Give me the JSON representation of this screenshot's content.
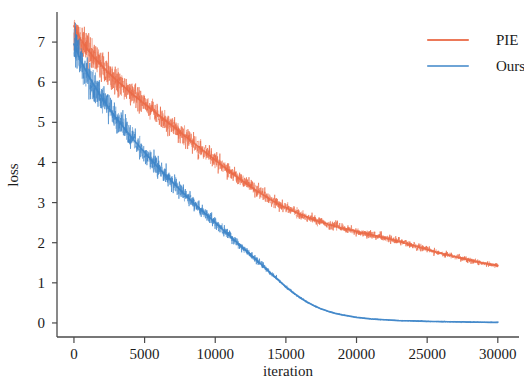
{
  "chart_data": {
    "type": "line",
    "title": "",
    "xlabel": "iteration",
    "ylabel": "loss",
    "xlim": [
      -1200,
      31500
    ],
    "ylim": [
      -0.35,
      7.75
    ],
    "xticks": [
      0,
      5000,
      10000,
      15000,
      20000,
      25000,
      30000
    ],
    "xtick_labels": [
      "0",
      "5000",
      "10000",
      "15000",
      "20000",
      "25000",
      "30000"
    ],
    "yticks": [
      0,
      1,
      2,
      3,
      4,
      5,
      6,
      7
    ],
    "ytick_labels": [
      "0",
      "1",
      "2",
      "3",
      "4",
      "5",
      "6",
      "7"
    ],
    "grid": false,
    "legend_position": "upper right",
    "series": [
      {
        "name": "PIE",
        "color": "#ea6a47",
        "noise_amplitude": 0.26,
        "x": [
          0,
          500,
          1000,
          1500,
          2000,
          2500,
          3000,
          3500,
          4000,
          4500,
          5000,
          5500,
          6000,
          6500,
          7000,
          7500,
          8000,
          8500,
          9000,
          9500,
          10000,
          10500,
          11000,
          11500,
          12000,
          12500,
          13000,
          13500,
          14000,
          14500,
          15000,
          15500,
          16000,
          16500,
          17000,
          17500,
          18000,
          18500,
          19000,
          19500,
          20000,
          20500,
          21000,
          21500,
          22000,
          22500,
          23000,
          23500,
          24000,
          24500,
          25000,
          25500,
          26000,
          26500,
          27000,
          27500,
          28000,
          28500,
          29000,
          29500,
          30000
        ],
        "values": [
          7.4,
          7.05,
          6.8,
          6.58,
          6.4,
          6.22,
          6.05,
          5.9,
          5.74,
          5.6,
          5.46,
          5.32,
          5.18,
          5.04,
          4.9,
          4.76,
          4.62,
          4.48,
          4.34,
          4.2,
          4.06,
          3.92,
          3.78,
          3.65,
          3.52,
          3.4,
          3.28,
          3.17,
          3.06,
          2.96,
          2.87,
          2.79,
          2.71,
          2.64,
          2.57,
          2.51,
          2.46,
          2.41,
          2.36,
          2.32,
          2.28,
          2.24,
          2.2,
          2.16,
          2.12,
          2.08,
          2.03,
          1.98,
          1.93,
          1.88,
          1.83,
          1.78,
          1.73,
          1.69,
          1.65,
          1.61,
          1.57,
          1.53,
          1.49,
          1.46,
          1.43
        ]
      },
      {
        "name": "Ours",
        "color": "#3d85c8",
        "noise_amplitude": 0.3,
        "x": [
          0,
          500,
          1000,
          1500,
          2000,
          2500,
          3000,
          3500,
          4000,
          4500,
          5000,
          5500,
          6000,
          6500,
          7000,
          7500,
          8000,
          8500,
          9000,
          9500,
          10000,
          10500,
          11000,
          11500,
          12000,
          12500,
          13000,
          13500,
          14000,
          14500,
          15000,
          15500,
          16000,
          16500,
          17000,
          17500,
          18000,
          18500,
          19000,
          19500,
          20000,
          20500,
          21000,
          21500,
          22000,
          22500,
          23000,
          23500,
          24000,
          24500,
          25000,
          25500,
          26000,
          26500,
          27000,
          27500,
          28000,
          28500,
          29000,
          29500,
          30000
        ],
        "values": [
          6.95,
          6.52,
          6.18,
          5.88,
          5.6,
          5.34,
          5.1,
          4.88,
          4.66,
          4.45,
          4.25,
          4.05,
          3.86,
          3.68,
          3.5,
          3.32,
          3.15,
          2.98,
          2.82,
          2.66,
          2.5,
          2.34,
          2.18,
          2.02,
          1.86,
          1.7,
          1.54,
          1.38,
          1.22,
          1.06,
          0.9,
          0.76,
          0.63,
          0.52,
          0.43,
          0.35,
          0.29,
          0.24,
          0.2,
          0.17,
          0.14,
          0.12,
          0.1,
          0.09,
          0.08,
          0.07,
          0.06,
          0.055,
          0.05,
          0.045,
          0.04,
          0.036,
          0.033,
          0.03,
          0.027,
          0.025,
          0.022,
          0.02,
          0.018,
          0.016,
          0.015
        ]
      }
    ]
  },
  "axes": {
    "xlabel": "iteration",
    "ylabel": "loss"
  },
  "legend": {
    "entries": [
      {
        "label": "PIE",
        "color": "#ea6a47"
      },
      {
        "label": "Ours",
        "color": "#3d85c8"
      }
    ]
  }
}
